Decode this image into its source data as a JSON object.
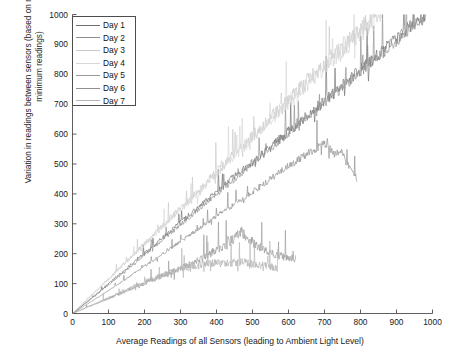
{
  "chart_data": {
    "type": "line",
    "title": "",
    "xlabel": "Average Readings of all Sensors (leading to Ambient Light Level)",
    "ylabel": "Variation in readings between sensors (based on maximum and minimum readings)",
    "xlim": [
      0,
      1000
    ],
    "ylim": [
      0,
      1000
    ],
    "xticks": [
      0,
      100,
      200,
      300,
      400,
      500,
      600,
      700,
      800,
      900,
      1000
    ],
    "yticks": [
      0,
      100,
      200,
      300,
      400,
      500,
      600,
      700,
      800,
      900,
      1000
    ],
    "xtick_labels": [
      "0",
      "100",
      "200",
      "300",
      "400",
      "500",
      "600",
      "700",
      "800",
      "900",
      "1000"
    ],
    "ytick_labels": [
      "0",
      "100",
      "200",
      "300",
      "400",
      "500",
      "600",
      "700",
      "800",
      "900",
      "1000"
    ],
    "grid": false,
    "legend_position": "upper-left",
    "legend_entries": [
      "Day 1",
      "Day 2",
      "Day 3",
      "Day 4",
      "Day 5",
      "Day 6",
      "Day 7"
    ],
    "series": [
      {
        "name": "Day 1",
        "color": "#6e6e6e",
        "noise": 0.055,
        "seed": 11,
        "points": [
          [
            0,
            0
          ],
          [
            60,
            58
          ],
          [
            140,
            140
          ],
          [
            250,
            252
          ],
          [
            380,
            385
          ],
          [
            520,
            525
          ],
          [
            660,
            668
          ],
          [
            800,
            812
          ],
          [
            900,
            915
          ],
          [
            985,
            1000
          ]
        ]
      },
      {
        "name": "Day 2",
        "color": "#8c8c8c",
        "noise": 0.05,
        "seed": 23,
        "points": [
          [
            0,
            0
          ],
          [
            70,
            66
          ],
          [
            160,
            155
          ],
          [
            280,
            276
          ],
          [
            400,
            398
          ],
          [
            540,
            540
          ],
          [
            680,
            684
          ],
          [
            820,
            828
          ],
          [
            905,
            918
          ],
          [
            980,
            1000
          ]
        ]
      },
      {
        "name": "Day 3",
        "color": "#c9c9c9",
        "noise": 0.07,
        "seed": 37,
        "points": [
          [
            0,
            0
          ],
          [
            55,
            62
          ],
          [
            130,
            150
          ],
          [
            230,
            268
          ],
          [
            340,
            398
          ],
          [
            440,
            520
          ],
          [
            540,
            640
          ],
          [
            640,
            760
          ],
          [
            760,
            900
          ],
          [
            845,
            1000
          ]
        ]
      },
      {
        "name": "Day 4",
        "color": "#d7d7d7",
        "noise": 0.065,
        "seed": 51,
        "points": [
          [
            0,
            0
          ],
          [
            60,
            70
          ],
          [
            150,
            172
          ],
          [
            260,
            300
          ],
          [
            370,
            430
          ],
          [
            470,
            548
          ],
          [
            570,
            668
          ],
          [
            670,
            786
          ],
          [
            780,
            912
          ],
          [
            860,
            1000
          ]
        ]
      },
      {
        "name": "Day 5",
        "color": "#9a9a9a",
        "noise": 0.14,
        "seed": 67,
        "points": [
          [
            0,
            0
          ],
          [
            80,
            40
          ],
          [
            170,
            85
          ],
          [
            260,
            130
          ],
          [
            350,
            175
          ],
          [
            430,
            232
          ],
          [
            470,
            270
          ],
          [
            500,
            238
          ],
          [
            540,
            205
          ],
          [
            580,
            190
          ],
          [
            620,
            180
          ]
        ]
      },
      {
        "name": "Day 6",
        "color": "#8f8f8f",
        "noise": 0.05,
        "seed": 83,
        "points": [
          [
            0,
            0
          ],
          [
            120,
            92
          ],
          [
            250,
            198
          ],
          [
            380,
            308
          ],
          [
            500,
            405
          ],
          [
            600,
            492
          ],
          [
            700,
            570
          ],
          [
            730,
            530
          ],
          [
            745,
            548
          ],
          [
            760,
            505
          ],
          [
            790,
            452
          ]
        ]
      },
      {
        "name": "Day 7",
        "color": "#b5b5b5",
        "noise": 0.16,
        "seed": 97,
        "points": [
          [
            0,
            0
          ],
          [
            70,
            36
          ],
          [
            150,
            78
          ],
          [
            230,
            118
          ],
          [
            310,
            152
          ],
          [
            380,
            168
          ],
          [
            430,
            165
          ],
          [
            470,
            172
          ],
          [
            510,
            162
          ],
          [
            540,
            158
          ],
          [
            570,
            150
          ]
        ]
      }
    ]
  },
  "axes": {
    "frame_color": "#4d4d4d",
    "background": "#ffffff"
  }
}
